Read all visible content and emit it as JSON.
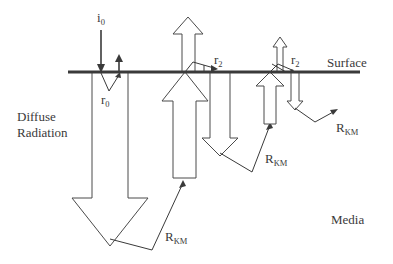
{
  "diagram": {
    "labels": {
      "incident": {
        "main": "i",
        "sub": "0"
      },
      "specular_reflection": {
        "main": "r",
        "sub": "0"
      },
      "surface": "Surface",
      "diffuse_radiation": {
        "line1": "Diffuse",
        "line2": "Radiation"
      },
      "media": "Media",
      "r2_a": {
        "main": "r",
        "sub": "2"
      },
      "r2_b": {
        "main": "r",
        "sub": "2"
      },
      "rkm_1": {
        "main": "R",
        "sub": "KM"
      },
      "rkm_2": {
        "main": "R",
        "sub": "KM"
      },
      "rkm_3": {
        "main": "R",
        "sub": "KM"
      }
    },
    "colors": {
      "line": "#3a3a3a",
      "arrow_outline": "#4a4a4a",
      "background": "#ffffff"
    }
  }
}
